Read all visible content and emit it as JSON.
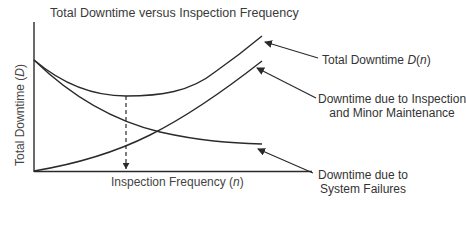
{
  "title": "Total Downtime versus Inspection Frequency",
  "axes": {
    "y_label_prefix": "Total Downtime (",
    "y_label_var": "D",
    "y_label_suffix": ")",
    "x_label_prefix": "Inspection Frequency (",
    "x_label_var": "n",
    "x_label_suffix": ")"
  },
  "labels": {
    "total": {
      "text": "Total Downtime ",
      "var": "D",
      "paren_open": "(",
      "arg": "n",
      "paren_close": ")"
    },
    "inspection": {
      "line1": "Downtime due to Inspection",
      "line2": "and Minor Maintenance"
    },
    "failures": {
      "line1": "Downtime due to",
      "line2": "System Failures"
    }
  },
  "colors": {
    "line": "#2a2a2a",
    "text": "#333333",
    "background": "#ffffff"
  },
  "curves": [
    {
      "name": "Total Downtime D(n)",
      "shape": "U-shaped, minimum at optimal n"
    },
    {
      "name": "Downtime due to Inspection and Minor Maintenance",
      "shape": "increasing"
    },
    {
      "name": "Downtime due to System Failures",
      "shape": "decreasing"
    }
  ],
  "annotation": {
    "optimum_marker": "dashed vertical line from total-downtime minimum to n-axis"
  }
}
